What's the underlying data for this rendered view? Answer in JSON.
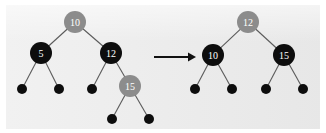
{
  "figure": {
    "background_color": "#e8e8e8",
    "page_background": "#ffffff",
    "node_fill_black": "#0d0d0d",
    "node_fill_gray": "#8c8c8c",
    "node_label_color": "#ffffff",
    "edge_color": "#5a5a5a",
    "arrow_color": "#111111"
  },
  "arrow": {
    "name": "transformation-arrow",
    "glyph": "→",
    "x1": 154,
    "x2": 196,
    "y": 57
  },
  "left_tree": {
    "name": "before-tree",
    "nodes": [
      {
        "id": "L-root",
        "label": "10",
        "color": "gray",
        "cx": 75,
        "cy": 22,
        "r": 11
      },
      {
        "id": "L-5",
        "label": "5",
        "color": "black",
        "cx": 41,
        "cy": 53,
        "r": 11
      },
      {
        "id": "L-12",
        "label": "12",
        "color": "black",
        "cx": 111,
        "cy": 53,
        "r": 11
      },
      {
        "id": "L-15",
        "label": "15",
        "color": "gray",
        "cx": 130,
        "cy": 86,
        "r": 11
      }
    ],
    "leaves": [
      {
        "id": "L-leaf-1",
        "cx": 22,
        "cy": 89,
        "r": 5
      },
      {
        "id": "L-leaf-2",
        "cx": 59,
        "cy": 89,
        "r": 5
      },
      {
        "id": "L-leaf-3",
        "cx": 92,
        "cy": 89,
        "r": 5
      },
      {
        "id": "L-leaf-4",
        "cx": 112,
        "cy": 119,
        "r": 5
      },
      {
        "id": "L-leaf-5",
        "cx": 149,
        "cy": 119,
        "r": 5
      }
    ],
    "edges": [
      {
        "from": "L-root",
        "to": "L-5"
      },
      {
        "from": "L-root",
        "to": "L-12"
      },
      {
        "from": "L-5",
        "to": "L-leaf-1"
      },
      {
        "from": "L-5",
        "to": "L-leaf-2"
      },
      {
        "from": "L-12",
        "to": "L-leaf-3"
      },
      {
        "from": "L-12",
        "to": "L-15"
      },
      {
        "from": "L-15",
        "to": "L-leaf-4"
      },
      {
        "from": "L-15",
        "to": "L-leaf-5"
      }
    ]
  },
  "right_tree": {
    "name": "after-tree",
    "nodes": [
      {
        "id": "R-root",
        "label": "12",
        "color": "gray",
        "cx": 248,
        "cy": 22,
        "r": 11
      },
      {
        "id": "R-10",
        "label": "10",
        "color": "black",
        "cx": 213,
        "cy": 55,
        "r": 11
      },
      {
        "id": "R-15",
        "label": "15",
        "color": "black",
        "cx": 284,
        "cy": 55,
        "r": 11
      }
    ],
    "leaves": [
      {
        "id": "R-leaf-1",
        "cx": 195,
        "cy": 89,
        "r": 5
      },
      {
        "id": "R-leaf-2",
        "cx": 232,
        "cy": 89,
        "r": 5
      },
      {
        "id": "R-leaf-3",
        "cx": 266,
        "cy": 89,
        "r": 5
      },
      {
        "id": "R-leaf-4",
        "cx": 303,
        "cy": 89,
        "r": 5
      }
    ],
    "edges": [
      {
        "from": "R-root",
        "to": "R-10"
      },
      {
        "from": "R-root",
        "to": "R-15"
      },
      {
        "from": "R-10",
        "to": "R-leaf-1"
      },
      {
        "from": "R-10",
        "to": "R-leaf-2"
      },
      {
        "from": "R-15",
        "to": "R-leaf-3"
      },
      {
        "from": "R-15",
        "to": "R-leaf-4"
      }
    ]
  }
}
